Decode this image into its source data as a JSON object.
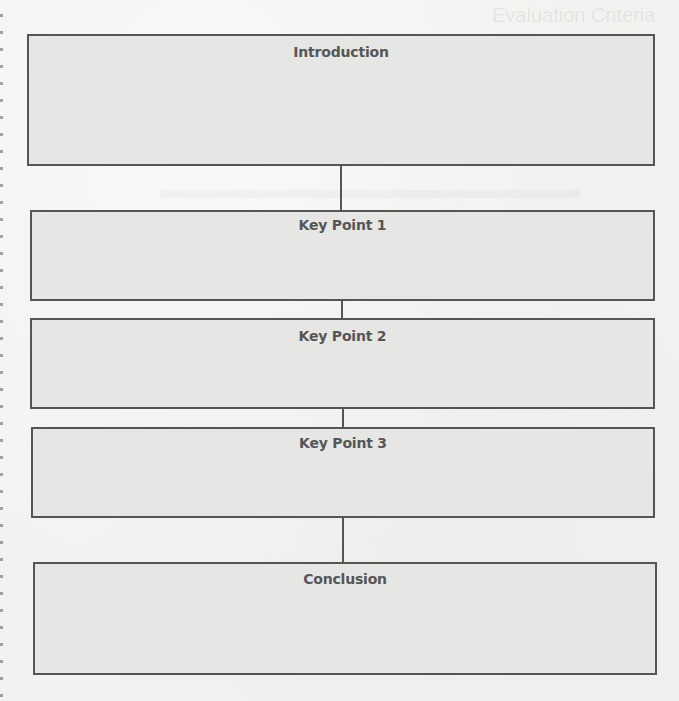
{
  "diagram": {
    "type": "vertical-flow",
    "colors": {
      "box_border": "#555555",
      "box_fill": "#e6e6e4",
      "heading_text": "#565656",
      "connector": "#555555",
      "paper": "#f2f2f0"
    },
    "boxes": [
      {
        "id": "introduction",
        "heading": "Introduction"
      },
      {
        "id": "key-point-1",
        "heading": "Key Point 1"
      },
      {
        "id": "key-point-2",
        "heading": "Key Point 2"
      },
      {
        "id": "key-point-3",
        "heading": "Key Point 3"
      },
      {
        "id": "conclusion",
        "heading": "Conclusion"
      }
    ],
    "edges": [
      [
        "introduction",
        "key-point-1"
      ],
      [
        "key-point-1",
        "key-point-2"
      ],
      [
        "key-point-2",
        "key-point-3"
      ],
      [
        "key-point-3",
        "conclusion"
      ]
    ]
  },
  "bleed_through": {
    "title": "Evaluation Criteria"
  }
}
